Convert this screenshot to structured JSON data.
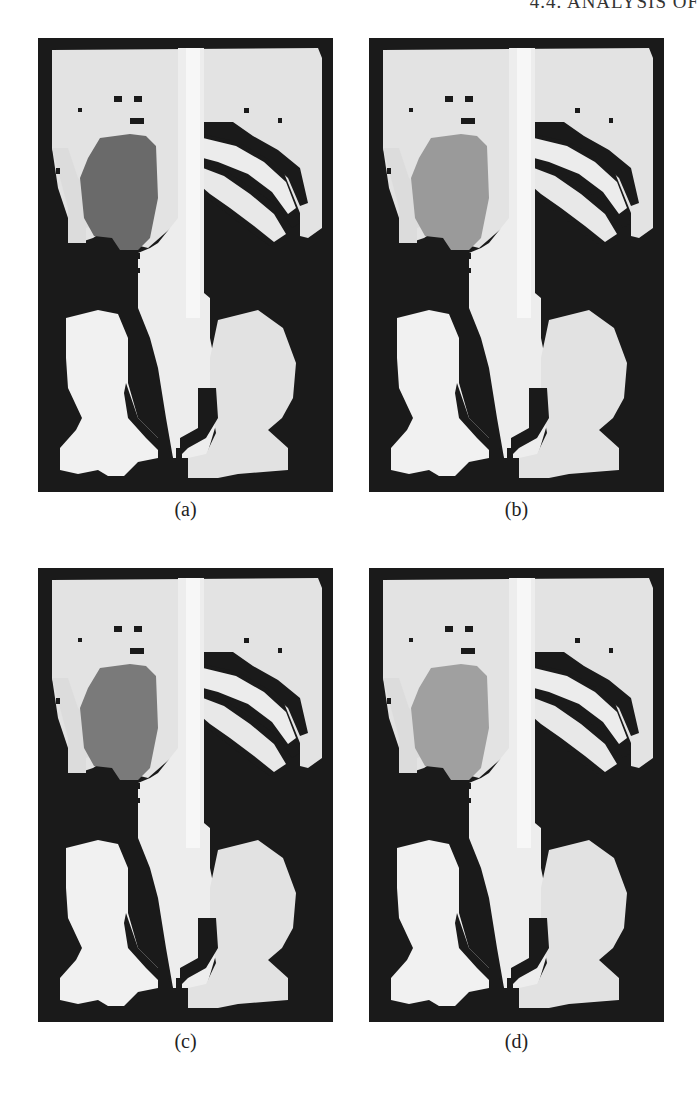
{
  "page": {
    "running_header": "4.4. ANALYSIS OF"
  },
  "figure": {
    "panels": [
      {
        "id": "a",
        "caption": "(a)",
        "organ_fill": "#6a6a6a"
      },
      {
        "id": "b",
        "caption": "(b)",
        "organ_fill": "#9a9a9a"
      },
      {
        "id": "c",
        "caption": "(c)",
        "organ_fill": "#7a7a7a"
      },
      {
        "id": "d",
        "caption": "(d)",
        "organ_fill": "#a0a0a0"
      }
    ],
    "colors": {
      "background": "#1a1a1a",
      "bone": "#e6e6e6",
      "bone_shade": "#cfcfcf",
      "spine": "#f4f4f4"
    }
  }
}
